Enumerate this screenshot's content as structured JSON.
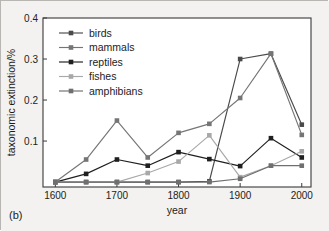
{
  "figure": {
    "panel_label": "(b)",
    "background_color": "#f3f2f0",
    "axis_color": "#3a3a3a"
  },
  "chart_data": {
    "type": "line",
    "title": "",
    "subtitle": "",
    "xlabel": "year",
    "ylabel": "taxonomic extinction/%",
    "x": [
      1600,
      1650,
      1700,
      1750,
      1800,
      1850,
      1900,
      1950,
      2000
    ],
    "xlim": [
      1580,
      2015
    ],
    "ylim": [
      -0.012,
      0.4
    ],
    "xticks": [
      1600,
      1700,
      1800,
      1900,
      2000
    ],
    "xtick_labels": [
      "1600",
      "1700",
      "1800",
      "1900",
      "2000"
    ],
    "yticks": [
      0.1,
      0.2,
      0.3,
      0.4
    ],
    "ytick_labels": [
      "0.1",
      "0.2",
      "0.3",
      "0.4"
    ],
    "grid": false,
    "legend_position": "upper-left",
    "series": [
      {
        "name": "birds",
        "color": "#4a4a4a",
        "marker": "square",
        "values": [
          0.0,
          0.0,
          0.0,
          0.0,
          0.0,
          0.002,
          0.3,
          0.313,
          0.14
        ]
      },
      {
        "name": "mammals",
        "color": "#757575",
        "marker": "square",
        "values": [
          0.0,
          0.055,
          0.15,
          0.06,
          0.12,
          0.142,
          0.205,
          0.313,
          0.115
        ]
      },
      {
        "name": "reptiles",
        "color": "#1f1f1f",
        "marker": "square",
        "values": [
          0.0,
          0.02,
          0.055,
          0.04,
          0.073,
          0.056,
          0.039,
          0.107,
          0.06
        ]
      },
      {
        "name": "fishes",
        "color": "#a8a8a8",
        "marker": "square",
        "values": [
          0.0,
          0.0,
          0.0,
          0.022,
          0.05,
          0.114,
          0.012,
          0.04,
          0.075
        ]
      },
      {
        "name": "amphibians",
        "color": "#6f6f6f",
        "marker": "square",
        "values": [
          0.0,
          0.0,
          0.0,
          0.0,
          0.0,
          0.0,
          0.008,
          0.04,
          0.04
        ]
      }
    ]
  }
}
